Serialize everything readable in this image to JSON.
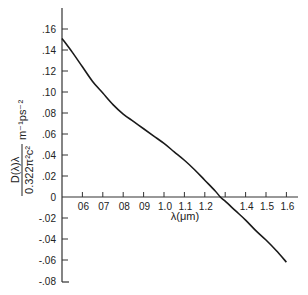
{
  "chart_data": {
    "type": "line",
    "title": "",
    "xlabel": "λ(μm)",
    "ylabel": {
      "numerator": "D(λ)λ",
      "denominator": "0.322π²c²",
      "units": "m⁻¹ps⁻²"
    },
    "xlim": [
      0.5,
      1.6
    ],
    "ylim": [
      -0.08,
      0.16
    ],
    "grid": false,
    "legend": "none",
    "x_ticks": [
      0.6,
      0.7,
      0.8,
      0.9,
      1.0,
      1.1,
      1.2,
      1.3,
      1.4,
      1.5,
      1.6
    ],
    "x_tick_labels": [
      "0.6",
      "0.7",
      "0.8",
      "0.9",
      "1.0",
      "1.1",
      "1.2",
      "",
      "1.4",
      "1.5",
      "1.6"
    ],
    "y_ticks": [
      0.16,
      0.14,
      0.12,
      0.1,
      0.08,
      0.06,
      0.04,
      0.02,
      0,
      -0.02,
      -0.04,
      -0.06,
      -0.08
    ],
    "y_tick_labels": [
      ".16",
      ".14",
      ".12",
      ".10",
      ".08",
      ".06",
      ".04",
      ".02",
      "0",
      "-.02",
      "-.04",
      "-.06",
      "-.08"
    ],
    "series": [
      {
        "name": "D(λ)λ",
        "x": [
          0.5,
          0.55,
          0.6,
          0.65,
          0.7,
          0.75,
          0.8,
          0.85,
          0.9,
          0.95,
          1.0,
          1.05,
          1.1,
          1.15,
          1.2,
          1.25,
          1.276,
          1.3,
          1.35,
          1.4,
          1.45,
          1.5,
          1.55,
          1.6
        ],
        "y": [
          0.151,
          0.138,
          0.124,
          0.11,
          0.099,
          0.088,
          0.079,
          0.072,
          0.065,
          0.058,
          0.051,
          0.043,
          0.035,
          0.026,
          0.016,
          0.006,
          0.0,
          -0.004,
          -0.013,
          -0.022,
          -0.032,
          -0.041,
          -0.051,
          -0.062
        ]
      }
    ]
  }
}
